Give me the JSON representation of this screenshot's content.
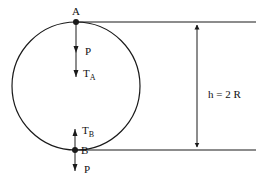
{
  "diagram": {
    "points": {
      "top": {
        "label": "A"
      },
      "bottom": {
        "label": "B"
      }
    },
    "forces": {
      "top_weight": {
        "label": "P"
      },
      "top_tension": {
        "label": "T",
        "subscript": "A"
      },
      "bottom_tension": {
        "label": "T",
        "subscript": "B"
      },
      "bottom_weight": {
        "label": "P"
      }
    },
    "dimension": {
      "label": "h = 2 R"
    },
    "colors": {
      "stroke": "#1a1a1a",
      "background": "#ffffff"
    }
  }
}
